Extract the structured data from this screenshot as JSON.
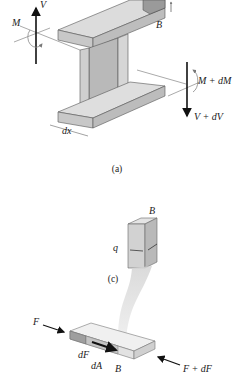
{
  "figure": {
    "part_a": {
      "caption": "(a)",
      "labels": {
        "shear_left": "V",
        "moment_left": "M",
        "point_b": "B",
        "moment_right": "M + dM",
        "shear_right": "V + dV",
        "length": "dx"
      }
    },
    "part_c": {
      "caption": "(c)",
      "labels": {
        "point_b": "B",
        "shear_flow": "q"
      }
    },
    "part_b_detail": {
      "labels": {
        "force_left": "F",
        "force_right": "F + dF",
        "force_increment": "dF",
        "area_element": "dA",
        "point_b": "B"
      }
    },
    "colors": {
      "flange_top": "#d8d8d8",
      "flange_side": "#bdbdbd",
      "web": "#c4c4c4",
      "line": "#1a1a1a",
      "beam_fill": "#e9e9e9"
    }
  }
}
